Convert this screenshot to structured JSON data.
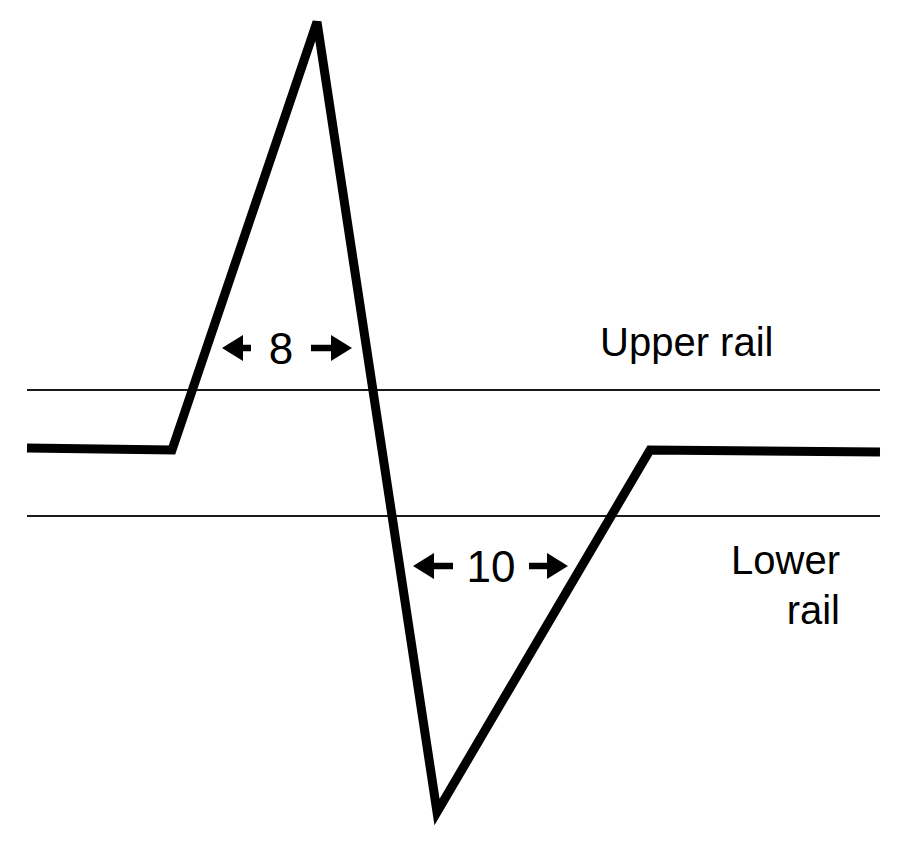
{
  "figure": {
    "background_color": "#ffffff",
    "line_color": "#000000",
    "rail_color": "#1a1a1a"
  },
  "labels": {
    "upper_rail": "Upper rail",
    "lower_rail_line1": "Lower",
    "lower_rail_line2": "rail"
  },
  "dimensions": [
    {
      "name": "rise-width",
      "value": "8"
    },
    {
      "name": "fall-width",
      "value": "10"
    }
  ],
  "chart_data": {
    "type": "line",
    "title": "",
    "xlabel": "",
    "ylabel": "",
    "grid": false,
    "legend_position": "none",
    "xlim": [
      0,
      897
    ],
    "ylim": [
      842,
      0
    ],
    "series": [
      {
        "name": "output waveform",
        "stroke": "#000000",
        "width": 9,
        "points": [
          [
            27,
            448
          ],
          [
            172,
            450
          ],
          [
            317,
            22
          ],
          [
            437,
            812
          ],
          [
            650,
            450
          ],
          [
            880,
            452
          ]
        ]
      }
    ],
    "reference_lines": [
      {
        "name": "upper-rail",
        "orientation": "horizontal",
        "y": 390,
        "x_start": 27,
        "x_end": 880,
        "label": "Upper rail",
        "stroke": "#1a1a1a",
        "width": 2.2
      },
      {
        "name": "lower-rail",
        "orientation": "horizontal",
        "y": 516,
        "x_start": 27,
        "x_end": 880,
        "label": "Lower rail",
        "stroke": "#1a1a1a",
        "width": 2.2
      }
    ],
    "annotations": [
      {
        "name": "dim-8",
        "text": "8",
        "type": "double-arrow",
        "y": 348,
        "x_start": 222,
        "x_end": 352,
        "text_x": 281,
        "gap_half": 30
      },
      {
        "name": "dim-10",
        "text": "10",
        "type": "double-arrow",
        "y": 566,
        "x_start": 413,
        "x_end": 568,
        "text_x": 491,
        "gap_half": 38
      },
      {
        "name": "upper-rail-text",
        "text": "Upper rail",
        "x": 600,
        "y": 356
      },
      {
        "name": "lower-rail-text-1",
        "text": "Lower",
        "x": 840,
        "y": 574
      },
      {
        "name": "lower-rail-text-2",
        "text": "rail",
        "x": 840,
        "y": 624
      }
    ]
  }
}
